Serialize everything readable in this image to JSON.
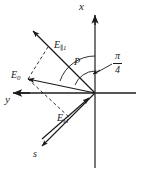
{
  "figure": {
    "type": "vector-diagram",
    "background_color": "#ffffff",
    "stroke_color": "#1a1a1a"
  },
  "axes": {
    "x_label": "x",
    "y_label": "y",
    "s_label": "s",
    "origin_px": [
      95,
      93
    ]
  },
  "angle": {
    "point_label": "P",
    "numerator": "π",
    "denominator": "4",
    "value_text": "π/4"
  },
  "vectors": [
    {
      "name": "E-parallel-1",
      "symbol": "E",
      "subscript_parallel": "∥",
      "subscript_index": "1",
      "label_text": "E",
      "direction": "upper-left"
    },
    {
      "name": "E-zero",
      "symbol": "E",
      "subscript_index": "0",
      "label_text": "E",
      "direction": "left"
    },
    {
      "name": "E-s-1",
      "symbol": "E",
      "subscript_index": "s1",
      "label_text": "E",
      "direction": "lower-left"
    }
  ],
  "labels": {
    "x": "x",
    "y": "y",
    "s": "s",
    "P": "P",
    "E": "E",
    "sub_parallel1": "∥1",
    "sub_0": "0",
    "sub_s1": "s1",
    "pi": "π",
    "four": "4"
  }
}
